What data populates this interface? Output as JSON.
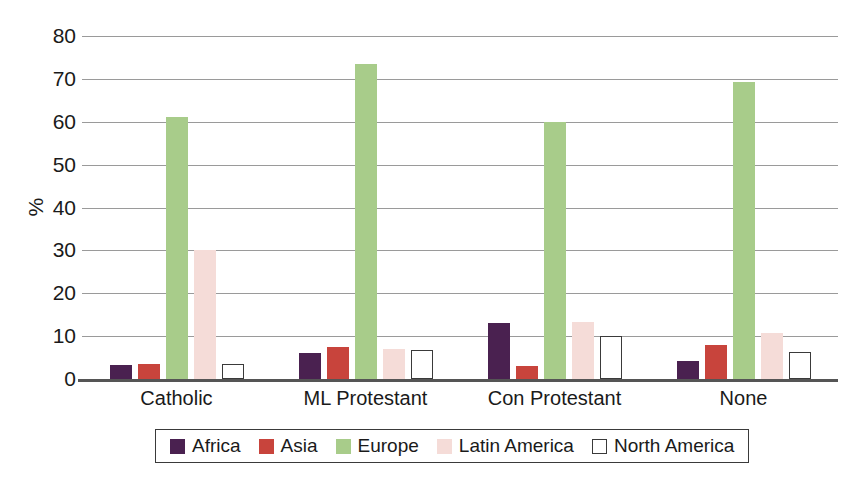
{
  "chart_data": {
    "type": "bar",
    "title": "",
    "xlabel": "",
    "ylabel": "%",
    "ylim": [
      0,
      80
    ],
    "yticks": [
      0,
      10,
      20,
      30,
      40,
      50,
      60,
      70,
      80
    ],
    "grid": true,
    "legend_position": "bottom",
    "categories": [
      "Catholic",
      "ML Protestant",
      "Con Protestant",
      "None"
    ],
    "series": [
      {
        "name": "Africa",
        "color": "#4a2150",
        "values": [
          3.3,
          6.0,
          13.0,
          4.2
        ]
      },
      {
        "name": "Asia",
        "color": "#c8443c",
        "values": [
          3.6,
          7.5,
          3.0,
          8.0
        ]
      },
      {
        "name": "Europe",
        "color": "#a8cc8a",
        "values": [
          61.0,
          73.5,
          60.0,
          69.3
        ]
      },
      {
        "name": "Latin America",
        "color": "#f5dcd8",
        "values": [
          30.0,
          7.0,
          13.3,
          10.8
        ]
      },
      {
        "name": "North America",
        "color": "#ffffff",
        "values": [
          3.5,
          6.8,
          10.0,
          6.2
        ]
      }
    ]
  },
  "axis": {
    "y_title": "%",
    "tick_labels": [
      "80",
      "70",
      "60",
      "50",
      "40",
      "30",
      "20",
      "10",
      "0"
    ]
  },
  "legend": {
    "items": [
      {
        "label": "Africa"
      },
      {
        "label": "Asia"
      },
      {
        "label": "Europe"
      },
      {
        "label": "Latin America"
      },
      {
        "label": "North America"
      }
    ]
  }
}
